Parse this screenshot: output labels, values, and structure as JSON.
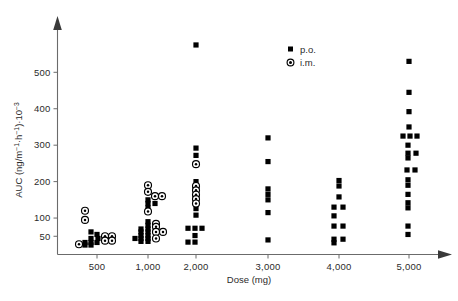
{
  "chart_data": {
    "type": "scatter",
    "title": "",
    "xlabel": "Dose (mg)",
    "ylabel": "AUC (ng·m⁻¹·h⁻¹)·10⁻³",
    "ylabel_parts": {
      "main": "AUC (ng",
      "unit_mid": "m",
      "sup1": "−1",
      "mid_dot": "·h",
      "sup2": "−1",
      "tail": ")·10",
      "sup3": "−3"
    },
    "x_categories": [
      "500",
      "1,000",
      "2,000",
      "3,000",
      "4,000",
      "5,000"
    ],
    "x_values": [
      500,
      1000,
      2000,
      3000,
      4000,
      5000
    ],
    "y_ticks": [
      50,
      100,
      200,
      300,
      400,
      500
    ],
    "y_tick_labels": [
      "50",
      "100",
      "200",
      "300",
      "400",
      "500"
    ],
    "ylim": [
      0,
      600
    ],
    "grid": false,
    "legend_position": "top-right",
    "legend": [
      {
        "key": "po",
        "label": "p.o.",
        "marker": "filled-square"
      },
      {
        "key": "im",
        "label": "i.m.",
        "marker": "circle-with-dot"
      }
    ],
    "series": [
      {
        "name": "p.o.",
        "marker": "filled-square",
        "color": "#000000",
        "points": [
          {
            "dose": 500,
            "auc": 62,
            "jitter": -6
          },
          {
            "dose": 500,
            "auc": 55,
            "jitter": 0
          },
          {
            "dose": 500,
            "auc": 44,
            "jitter": -6
          },
          {
            "dose": 500,
            "auc": 44,
            "jitter": 1
          },
          {
            "dose": 500,
            "auc": 33,
            "jitter": -12
          },
          {
            "dose": 500,
            "auc": 33,
            "jitter": -6
          },
          {
            "dose": 500,
            "auc": 33,
            "jitter": 0
          },
          {
            "dose": 500,
            "auc": 26,
            "jitter": -12
          },
          {
            "dose": 500,
            "auc": 26,
            "jitter": -6
          },
          {
            "dose": 1000,
            "auc": 150,
            "jitter": 0
          },
          {
            "dose": 1000,
            "auc": 140,
            "jitter": 0
          },
          {
            "dose": 1000,
            "auc": 140,
            "jitter": 7
          },
          {
            "dose": 1000,
            "auc": 128,
            "jitter": 0
          },
          {
            "dose": 1000,
            "auc": 90,
            "jitter": 0
          },
          {
            "dose": 1000,
            "auc": 80,
            "jitter": 0
          },
          {
            "dose": 1000,
            "auc": 70,
            "jitter": -7
          },
          {
            "dose": 1000,
            "auc": 70,
            "jitter": 0
          },
          {
            "dose": 1000,
            "auc": 62,
            "jitter": -7
          },
          {
            "dose": 1000,
            "auc": 62,
            "jitter": 0
          },
          {
            "dose": 1000,
            "auc": 52,
            "jitter": -7
          },
          {
            "dose": 1000,
            "auc": 52,
            "jitter": 0
          },
          {
            "dose": 1000,
            "auc": 44,
            "jitter": -13
          },
          {
            "dose": 1000,
            "auc": 44,
            "jitter": -7
          },
          {
            "dose": 1000,
            "auc": 44,
            "jitter": 0
          },
          {
            "dose": 1000,
            "auc": 36,
            "jitter": -7
          },
          {
            "dose": 1000,
            "auc": 36,
            "jitter": 0
          },
          {
            "dose": 2000,
            "auc": 575,
            "jitter": 0
          },
          {
            "dose": 2000,
            "auc": 292,
            "jitter": 0
          },
          {
            "dose": 2000,
            "auc": 272,
            "jitter": 0
          },
          {
            "dose": 2000,
            "auc": 200,
            "jitter": 0
          },
          {
            "dose": 2000,
            "auc": 126,
            "jitter": 0
          },
          {
            "dose": 2000,
            "auc": 108,
            "jitter": 0
          },
          {
            "dose": 2000,
            "auc": 72,
            "jitter": -8
          },
          {
            "dose": 2000,
            "auc": 72,
            "jitter": -1
          },
          {
            "dose": 2000,
            "auc": 72,
            "jitter": 6
          },
          {
            "dose": 2000,
            "auc": 52,
            "jitter": -1
          },
          {
            "dose": 2000,
            "auc": 34,
            "jitter": -8
          },
          {
            "dose": 2000,
            "auc": 34,
            "jitter": -1
          },
          {
            "dose": 3000,
            "auc": 320,
            "jitter": 0
          },
          {
            "dose": 3000,
            "auc": 255,
            "jitter": 0
          },
          {
            "dose": 3000,
            "auc": 180,
            "jitter": 0
          },
          {
            "dose": 3000,
            "auc": 165,
            "jitter": 0
          },
          {
            "dose": 3000,
            "auc": 150,
            "jitter": 0
          },
          {
            "dose": 3000,
            "auc": 115,
            "jitter": 0
          },
          {
            "dose": 3000,
            "auc": 40,
            "jitter": 0
          },
          {
            "dose": 4000,
            "auc": 203,
            "jitter": 0
          },
          {
            "dose": 4000,
            "auc": 188,
            "jitter": 0
          },
          {
            "dose": 4000,
            "auc": 158,
            "jitter": 0
          },
          {
            "dose": 4000,
            "auc": 130,
            "jitter": -5
          },
          {
            "dose": 4000,
            "auc": 130,
            "jitter": 4
          },
          {
            "dose": 4000,
            "auc": 106,
            "jitter": -5
          },
          {
            "dose": 4000,
            "auc": 78,
            "jitter": -5
          },
          {
            "dose": 4000,
            "auc": 78,
            "jitter": 4
          },
          {
            "dose": 4000,
            "auc": 42,
            "jitter": -5
          },
          {
            "dose": 4000,
            "auc": 42,
            "jitter": 4
          },
          {
            "dose": 4000,
            "auc": 32,
            "jitter": -5
          },
          {
            "dose": 5000,
            "auc": 530,
            "jitter": 0
          },
          {
            "dose": 5000,
            "auc": 445,
            "jitter": 0
          },
          {
            "dose": 5000,
            "auc": 392,
            "jitter": 0
          },
          {
            "dose": 5000,
            "auc": 350,
            "jitter": 0
          },
          {
            "dose": 5000,
            "auc": 325,
            "jitter": -6
          },
          {
            "dose": 5000,
            "auc": 325,
            "jitter": 1
          },
          {
            "dose": 5000,
            "auc": 325,
            "jitter": 8
          },
          {
            "dose": 5000,
            "auc": 300,
            "jitter": -1
          },
          {
            "dose": 5000,
            "auc": 278,
            "jitter": -1
          },
          {
            "dose": 5000,
            "auc": 278,
            "jitter": 7
          },
          {
            "dose": 5000,
            "auc": 265,
            "jitter": -1
          },
          {
            "dose": 5000,
            "auc": 232,
            "jitter": -2
          },
          {
            "dose": 5000,
            "auc": 232,
            "jitter": 6
          },
          {
            "dose": 5000,
            "auc": 205,
            "jitter": -1
          },
          {
            "dose": 5000,
            "auc": 190,
            "jitter": -1
          },
          {
            "dose": 5000,
            "auc": 165,
            "jitter": -1
          },
          {
            "dose": 5000,
            "auc": 142,
            "jitter": -1
          },
          {
            "dose": 5000,
            "auc": 128,
            "jitter": -1
          },
          {
            "dose": 5000,
            "auc": 78,
            "jitter": -1
          },
          {
            "dose": 5000,
            "auc": 55,
            "jitter": -1
          }
        ]
      },
      {
        "name": "i.m.",
        "marker": "circle-with-dot",
        "color": "#000000",
        "points": [
          {
            "dose": 500,
            "auc": 120,
            "jitter": -12
          },
          {
            "dose": 500,
            "auc": 95,
            "jitter": -12
          },
          {
            "dose": 500,
            "auc": 50,
            "jitter": 8
          },
          {
            "dose": 500,
            "auc": 50,
            "jitter": 15
          },
          {
            "dose": 500,
            "auc": 38,
            "jitter": 8
          },
          {
            "dose": 500,
            "auc": 38,
            "jitter": 15
          },
          {
            "dose": 500,
            "auc": 28,
            "jitter": -18
          },
          {
            "dose": 1000,
            "auc": 190,
            "jitter": 0
          },
          {
            "dose": 1000,
            "auc": 172,
            "jitter": 0
          },
          {
            "dose": 1000,
            "auc": 160,
            "jitter": 7
          },
          {
            "dose": 1000,
            "auc": 160,
            "jitter": 14
          },
          {
            "dose": 1000,
            "auc": 118,
            "jitter": 0
          },
          {
            "dose": 1000,
            "auc": 84,
            "jitter": 8
          },
          {
            "dose": 1000,
            "auc": 76,
            "jitter": 8
          },
          {
            "dose": 1000,
            "auc": 62,
            "jitter": 8
          },
          {
            "dose": 1000,
            "auc": 62,
            "jitter": 15
          },
          {
            "dose": 1000,
            "auc": 44,
            "jitter": 8
          },
          {
            "dose": 2000,
            "auc": 248,
            "jitter": 0
          },
          {
            "dose": 2000,
            "auc": 188,
            "jitter": 0
          },
          {
            "dose": 2000,
            "auc": 176,
            "jitter": 0
          },
          {
            "dose": 2000,
            "auc": 164,
            "jitter": 0
          },
          {
            "dose": 2000,
            "auc": 152,
            "jitter": 0
          },
          {
            "dose": 2000,
            "auc": 140,
            "jitter": 0
          }
        ]
      }
    ]
  },
  "axes": {
    "y_axis_name": "auc-axis",
    "x_axis_name": "dose-axis"
  }
}
